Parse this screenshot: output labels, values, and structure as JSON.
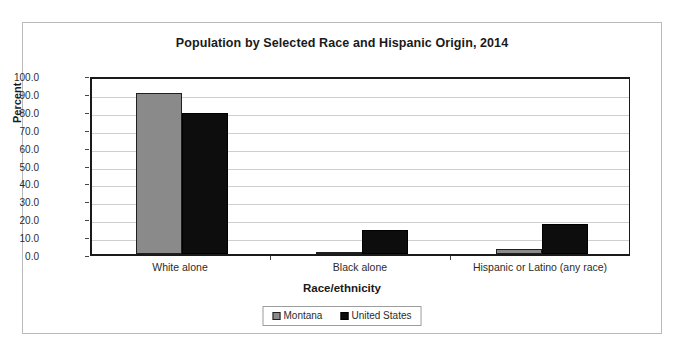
{
  "chart_data": {
    "type": "bar",
    "title": "Population by Selected Race and Hispanic Origin, 2014",
    "xlabel": "Race/ethnicity",
    "ylabel": "Percent",
    "categories": [
      "White alone",
      "Black alone",
      "Hispanic or Latino (any race)"
    ],
    "series": [
      {
        "name": "Montana",
        "color": "#8a8a8a",
        "values": [
          90.1,
          0.4,
          2.9
        ]
      },
      {
        "name": "United States",
        "color": "#0d0d0d",
        "values": [
          78.8,
          13.2,
          16.9
        ]
      }
    ],
    "ylim": [
      0,
      100
    ],
    "ytick_step": 10,
    "ytick_labels": [
      "100.0",
      "90.0",
      "80.0",
      "70.0",
      "60.0",
      "50.0",
      "40.0",
      "30.0",
      "20.0",
      "10.0",
      "0.0"
    ],
    "ytick_values": [
      100,
      90,
      80,
      70,
      60,
      50,
      40,
      30,
      20,
      10,
      0
    ],
    "grid": true,
    "legend_position": "bottom"
  }
}
